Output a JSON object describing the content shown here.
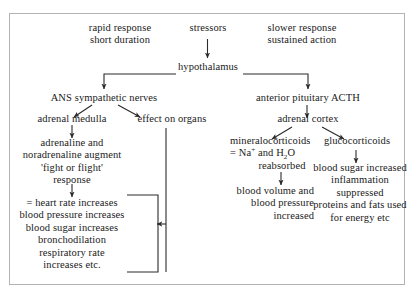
{
  "figure": {
    "border_color": "#b3b3b3",
    "line_color": "#2b2b2b",
    "text_color": "#1a1a1a"
  },
  "nodes": {
    "rapid_response": "rapid response\nshort duration",
    "stressors": "stressors",
    "slower_response": "slower response\nsustained action",
    "hypothalamus": "hypothalamus",
    "ans_sympathetic_nerves": "ANS sympathetic nerves",
    "anterior_pituitary_acth": "anterior pituitary ACTH",
    "adrenal_medulla": "adrenal medulla",
    "effect_on_organs": "effect on organs",
    "adrenal_cortex": "adrenal cortex",
    "adrenaline_augment": "adrenaline and\nnoradrenaline augment\n'fight or flight'\nresponse",
    "mineralocorticoids_label": "mineralocorticoids",
    "mineralocorticoids_detail_prefix": "= Na",
    "mineralocorticoids_detail_sup": "+",
    "mineralocorticoids_detail_mid": " and H",
    "mineralocorticoids_detail_sub": "2",
    "mineralocorticoids_detail_suffix": "O",
    "mineralocorticoids_reabsorbed": "reabsorbed",
    "glucocorticoids_label": "glucocorticoids",
    "heart_rate_block": "= heart rate increases\nblood pressure increases\nblood sugar increases\nbronchodilation\nrespiratory rate\nincreases etc.",
    "blood_volume_block": "blood volume and\nblood pressure\nincreased",
    "glucocorticoid_effects": "blood sugar increased\ninflammation\nsuppressed\nproteins and fats used\nfor energy etc"
  }
}
